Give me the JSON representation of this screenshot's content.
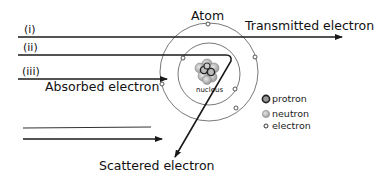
{
  "labels": {
    "atom": "Atom",
    "transmitted": "Transmitted electron",
    "absorbed": "Absorbed electron",
    "scattered": "Scattered electron",
    "nucleus": "nucleus",
    "path_i": "(i)",
    "path_ii": "(ii)",
    "path_iii": "(iii)"
  },
  "legend": {
    "items": [
      {
        "label": "protron",
        "icon": "proton-icon"
      },
      {
        "label": "neutron",
        "icon": "neutron-icon"
      },
      {
        "label": "electron",
        "icon": "electron-icon"
      }
    ]
  },
  "colors": {
    "line": "#1a1a1a",
    "orbit": "#555555",
    "proton": "#333333",
    "neutron": "#b0b0b0",
    "electron": "#444444"
  }
}
